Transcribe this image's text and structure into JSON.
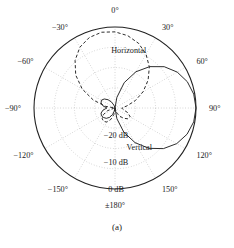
{
  "figure": {
    "caption": "(a)",
    "type": "polar-radiation-pattern"
  },
  "chart_data": {
    "type": "line",
    "polar": true,
    "title": "",
    "subtitle": "",
    "xlabel": "",
    "ylabel": "",
    "caption": "(a)",
    "grid": true,
    "legend_position": "inline-annotation",
    "angle_unit": "degrees",
    "angle_zero_at": "top",
    "angle_direction": "clockwise-positive",
    "radial_unit": "dB",
    "radial_range_db": [
      -30,
      0
    ],
    "radial_ticks_db": [
      0,
      -10,
      -20
    ],
    "radial_tick_labels": [
      "0 dB",
      "−10 dB",
      "−20 dB"
    ],
    "angle_ticks": [
      0,
      30,
      60,
      90,
      120,
      150,
      180,
      -150,
      -120,
      -90,
      -60,
      -30
    ],
    "angle_tick_labels": [
      "0°",
      "30°",
      "60°",
      "90°",
      "120°",
      "150°",
      "±180°",
      "−150°",
      "−120°",
      "−90°",
      "−60°",
      "−30°"
    ],
    "series": [
      {
        "name": "Vertical",
        "label": "Vertical",
        "style": "solid",
        "color": "#222222",
        "peak_angle_deg": 90,
        "peak_value_db": 0,
        "angles_deg": [
          -180,
          -170,
          -160,
          -150,
          -140,
          -130,
          -120,
          -110,
          -100,
          -90,
          -80,
          -70,
          -60,
          -50,
          -40,
          -30,
          -20,
          -10,
          0,
          10,
          20,
          30,
          40,
          50,
          60,
          70,
          80,
          90,
          100,
          110,
          120,
          130,
          140,
          150,
          160,
          170,
          180
        ],
        "values_db": [
          -30,
          -29,
          -27.5,
          -26,
          -25,
          -24.5,
          -24.2,
          -24.5,
          -25.5,
          -27,
          -25.5,
          -24.5,
          -24.2,
          -24.8,
          -26,
          -27.5,
          -29,
          -30,
          -30,
          -26,
          -20,
          -14.5,
          -10,
          -6.2,
          -3.4,
          -1.5,
          -0.4,
          0,
          -0.4,
          -1.6,
          -3.6,
          -6.6,
          -10.5,
          -15.2,
          -20.5,
          -26,
          -30
        ]
      },
      {
        "name": "Horizontal",
        "label": "Horizontal",
        "style": "dashed",
        "color": "#222222",
        "peak_angle_deg": -10,
        "peak_value_db": -1.5,
        "angles_deg": [
          -180,
          -170,
          -160,
          -150,
          -140,
          -130,
          -120,
          -110,
          -100,
          -90,
          -80,
          -70,
          -60,
          -50,
          -40,
          -30,
          -20,
          -10,
          0,
          10,
          20,
          30,
          40,
          50,
          60,
          70,
          80,
          90,
          100,
          110,
          120,
          130,
          140,
          150,
          160,
          170,
          180
        ],
        "values_db": [
          -30,
          -27.5,
          -25.5,
          -24,
          -23.5,
          -23.8,
          -25,
          -27,
          -29.5,
          -30,
          -26.5,
          -21.5,
          -16,
          -11,
          -7,
          -4,
          -2.2,
          -1.5,
          -1.8,
          -2.8,
          -4.5,
          -7,
          -10.2,
          -14,
          -18,
          -22,
          -25.5,
          -27.5,
          -27,
          -25,
          -23.5,
          -23.8,
          -25,
          -26.5,
          -28,
          -29.5,
          -30
        ]
      }
    ],
    "annotations": [
      {
        "text": "Horizontal",
        "angle_deg": 12,
        "radius_frac": 0.72
      },
      {
        "text": "Vertical",
        "angle_deg": 152,
        "radius_frac": 0.62
      },
      {
        "text": "−20 dB",
        "angle_deg": 180,
        "radius_frac": 0.3
      },
      {
        "text": "−10 dB",
        "angle_deg": 180,
        "radius_frac": 0.63
      },
      {
        "text": "0 dB",
        "angle_deg": 180,
        "radius_frac": 0.96
      }
    ]
  },
  "labels": {
    "horizontal": "Horizontal",
    "vertical": "Vertical",
    "db_0": "0 dB",
    "db_10": "−10 dB",
    "db_20": "−20 dB",
    "a0": "0°",
    "a30": "30°",
    "a60": "60°",
    "a90": "90°",
    "a120": "120°",
    "a150": "150°",
    "a180": "±180°",
    "am150": "−150°",
    "am120": "−120°",
    "am90": "−90°",
    "am60": "−60°",
    "am30": "−30°"
  }
}
